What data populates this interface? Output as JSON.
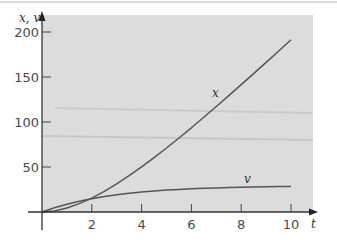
{
  "chart_data": {
    "type": "line",
    "title": "",
    "xlabel": "t",
    "ylabel": "x, v",
    "xlim": [
      0,
      11
    ],
    "ylim": [
      0,
      215
    ],
    "x_ticks": [
      2,
      4,
      6,
      8,
      10
    ],
    "x_tick_labels": [
      "2",
      "4",
      "6",
      "8",
      "10"
    ],
    "y_ticks": [
      50,
      100,
      150,
      200
    ],
    "y_tick_labels": [
      "50",
      "100",
      "150",
      "200"
    ],
    "grid": false,
    "legend": "none (curves labeled inline)",
    "series": [
      {
        "name": "x",
        "label": "x",
        "x": [
          0,
          0.5,
          1,
          1.5,
          2,
          2.5,
          3,
          3.5,
          4,
          4.5,
          5,
          5.5,
          6,
          6.5,
          7,
          7.5,
          8,
          8.5,
          9,
          9.5,
          10
        ],
        "values": [
          0,
          1.2,
          4.4,
          9.3,
          15.5,
          22.9,
          31.3,
          40.4,
          50.1,
          60.4,
          71.1,
          82.2,
          93.6,
          105.3,
          117.2,
          129.3,
          141.5,
          153.8,
          166.2,
          178.7,
          191.3
        ]
      },
      {
        "name": "v",
        "label": "v",
        "x": [
          0,
          0.5,
          1,
          1.5,
          2,
          2.5,
          3,
          3.5,
          4,
          4.5,
          5,
          5.5,
          6,
          6.5,
          7,
          7.5,
          8,
          8.5,
          9,
          9.5,
          10
        ],
        "values": [
          0,
          4.7,
          8.7,
          12.0,
          14.8,
          17.2,
          19.1,
          20.8,
          22.1,
          23.3,
          24.3,
          25.1,
          25.8,
          26.3,
          26.8,
          27.2,
          27.5,
          27.8,
          28.0,
          28.2,
          28.4
        ]
      }
    ]
  }
}
